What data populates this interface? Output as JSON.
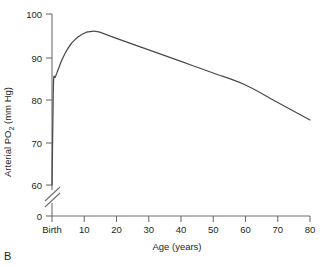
{
  "panel": {
    "label": "B"
  },
  "chart_data": {
    "type": "line",
    "title": "",
    "xlabel": "Age (years)",
    "ylabel": "Arterial PO2 (mm Hg)",
    "ylabel_main": "Arterial PO",
    "ylabel_sub": "2",
    "ylabel_tail": " (mm Hg)",
    "xlim": [
      0,
      80
    ],
    "ylim": [
      60,
      100
    ],
    "y_axis_break": true,
    "y_break_between": [
      0,
      60
    ],
    "grid": false,
    "legend": null,
    "xticklabels": [
      "Birth",
      "10",
      "20",
      "30",
      "40",
      "50",
      "60",
      "70",
      "80"
    ],
    "xtickvalues": [
      0,
      10,
      20,
      30,
      40,
      50,
      60,
      70,
      80
    ],
    "yticklabels": [
      "0",
      "60",
      "70",
      "80",
      "90",
      "100"
    ],
    "ytickvalues": [
      0,
      60,
      70,
      80,
      90,
      100
    ],
    "series": [
      {
        "name": "Arterial PO2 vs age",
        "x": [
          0,
          0.25,
          0.5,
          1,
          2,
          3,
          4,
          5,
          6,
          7,
          8,
          9,
          10,
          11,
          12,
          13,
          14,
          15,
          20,
          30,
          40,
          50,
          60,
          70,
          80
        ],
        "values": [
          60,
          74,
          84.6,
          85.2,
          87.2,
          89.1,
          90.7,
          92.0,
          93.1,
          93.9,
          94.6,
          95.1,
          95.5,
          95.8,
          95.9,
          96.0,
          95.9,
          95.7,
          94.3,
          91.6,
          88.9,
          86.2,
          83.4,
          79.3,
          75.2
        ]
      }
    ],
    "annotations": [
      {
        "text": "axis break on y-axis below 60 mm Hg"
      }
    ],
    "colors": {
      "curve": "#4a4a4a",
      "axis": "#6e6e6e",
      "text": "#231f20"
    }
  }
}
